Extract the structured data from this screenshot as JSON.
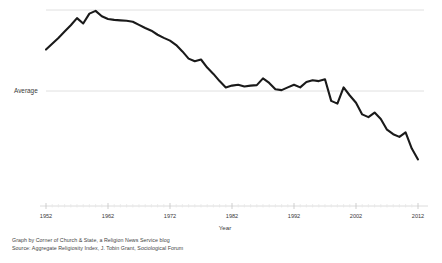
{
  "chart_data": {
    "type": "line",
    "title": "",
    "xlabel": "Year",
    "ylabel": "",
    "x": [
      1952,
      1953,
      1954,
      1955,
      1956,
      1957,
      1958,
      1959,
      1960,
      1961,
      1962,
      1963,
      1964,
      1965,
      1966,
      1967,
      1968,
      1969,
      1970,
      1971,
      1972,
      1973,
      1974,
      1975,
      1976,
      1977,
      1978,
      1979,
      1980,
      1981,
      1982,
      1983,
      1984,
      1985,
      1986,
      1987,
      1988,
      1989,
      1990,
      1991,
      1992,
      1993,
      1994,
      1995,
      1996,
      1997,
      1998,
      1999,
      2000,
      2001,
      2002,
      2003,
      2004,
      2005,
      2006,
      2007,
      2008,
      2009,
      2010,
      2011,
      2012
    ],
    "values": [
      0.92,
      1.05,
      1.18,
      1.32,
      1.46,
      1.62,
      1.5,
      1.72,
      1.78,
      1.66,
      1.6,
      1.58,
      1.57,
      1.56,
      1.54,
      1.47,
      1.4,
      1.34,
      1.25,
      1.18,
      1.12,
      1.02,
      0.88,
      0.72,
      0.66,
      0.7,
      0.52,
      0.38,
      0.22,
      0.08,
      0.12,
      0.14,
      0.1,
      0.12,
      0.13,
      0.28,
      0.18,
      0.04,
      0.02,
      0.08,
      0.14,
      0.08,
      0.2,
      0.24,
      0.22,
      0.26,
      -0.22,
      -0.28,
      0.08,
      -0.1,
      -0.26,
      -0.52,
      -0.58,
      -0.48,
      -0.62,
      -0.86,
      -0.96,
      -1.02,
      -0.92,
      -1.28,
      -1.52
    ],
    "xlim": [
      1952,
      2012
    ],
    "ylim": [
      -1.8,
      2.05
    ],
    "grid": true,
    "legend": false,
    "xticks": [
      "1952",
      "1962",
      "1972",
      "1982",
      "1992",
      "2002",
      "2012"
    ],
    "xtick_values": [
      1952,
      1962,
      1972,
      1982,
      1992,
      2002,
      2012
    ],
    "yreference": {
      "label": "Average",
      "value": 0
    },
    "line_color": "#1a1a1a",
    "grid_color": "#e0e0e0",
    "axis_color": "#d8d8d8",
    "annotations": []
  },
  "caption": {
    "line1": "Graph by Corner of Church & State, a Religion News Service blog",
    "line2": "Source: Aggregate Religiosity Index, J. Tobin Grant, Sociological Forum"
  }
}
